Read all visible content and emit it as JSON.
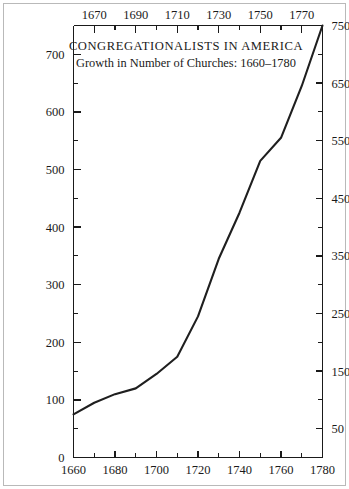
{
  "chart_data": {
    "type": "line",
    "title": "CONGREGATIONALISTS IN AMERICA",
    "subtitle": "Growth in Number of Churches: 1660–1780",
    "xlabel": "",
    "ylabel": "",
    "xlim": [
      1660,
      1780
    ],
    "ylim": [
      0,
      750
    ],
    "grid": false,
    "legend": null,
    "x": [
      1660,
      1670,
      1680,
      1690,
      1700,
      1710,
      1720,
      1730,
      1740,
      1750,
      1760,
      1770,
      1780
    ],
    "values": [
      75,
      95,
      110,
      120,
      145,
      175,
      245,
      345,
      425,
      515,
      555,
      645,
      750
    ],
    "series": [
      {
        "name": "Number of Churches",
        "values": [
          75,
          95,
          110,
          120,
          145,
          175,
          245,
          345,
          425,
          515,
          555,
          645,
          750
        ]
      }
    ],
    "axes": {
      "bottom": {
        "ticks": [
          1660,
          1680,
          1700,
          1720,
          1740,
          1760,
          1780
        ],
        "tick_labels": [
          "1660",
          "1680",
          "1700",
          "1720",
          "1740",
          "1760",
          "1780"
        ],
        "minor_ticks": [
          1670,
          1690,
          1710,
          1730,
          1750,
          1770
        ]
      },
      "top": {
        "ticks": [
          1670,
          1690,
          1710,
          1730,
          1750,
          1770
        ],
        "tick_labels": [
          "1670",
          "1690",
          "1710",
          "1730",
          "1750",
          "1770"
        ],
        "minor_ticks": [
          1660,
          1680,
          1700,
          1720,
          1740,
          1760,
          1780
        ]
      },
      "left": {
        "ticks": [
          0,
          100,
          200,
          300,
          400,
          500,
          600,
          700
        ],
        "tick_labels": [
          "0",
          "100",
          "200",
          "300",
          "400",
          "500",
          "600",
          "700"
        ],
        "minor_ticks": [
          50,
          150,
          250,
          350,
          450,
          550,
          650,
          750
        ]
      },
      "right": {
        "ticks": [
          50,
          150,
          250,
          350,
          450,
          550,
          650,
          750
        ],
        "tick_labels": [
          "50",
          "150",
          "250",
          "350",
          "450",
          "550",
          "650",
          "750"
        ],
        "minor_ticks": [
          0,
          100,
          200,
          300,
          400,
          500,
          600,
          700
        ]
      }
    },
    "colors": {
      "line": "#1f1f1f",
      "axis": "#1a1a1a",
      "text": "#1a1a1a",
      "background": "#ffffff",
      "border": "#b9b9b9"
    }
  }
}
